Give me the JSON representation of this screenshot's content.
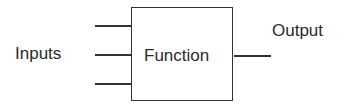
{
  "diagram": {
    "inputs_label": "Inputs",
    "function_label": "Function",
    "output_label": "Output",
    "input_count": 3,
    "output_count": 1
  }
}
